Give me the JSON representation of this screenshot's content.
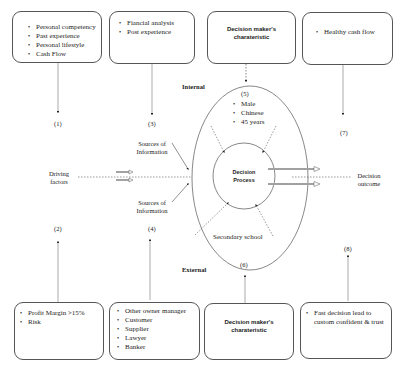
{
  "diagram": {
    "sections": {
      "internal": "Internal",
      "external": "External"
    },
    "top_boxes": [
      {
        "id": "1",
        "items": [
          "Personal competency",
          "Past experience",
          "Personal lifestyle",
          "Cash Flow"
        ]
      },
      {
        "id": "3",
        "items": [
          "Fiancial analysis",
          "Post experience"
        ]
      },
      {
        "id": "5",
        "title": "Decision maker's charateristic"
      },
      {
        "id": "7",
        "items": [
          "Healthy cash flow"
        ]
      }
    ],
    "bottom_boxes": [
      {
        "id": "2",
        "items": [
          "Profit Margin >15%",
          "Risk"
        ]
      },
      {
        "id": "4",
        "items": [
          "Other owner manager",
          "Customer",
          "Supplier",
          "Lawyer",
          "Banker"
        ]
      },
      {
        "id": "6",
        "title": "Decision maker's charateristic"
      },
      {
        "id": "8",
        "items": [
          "Fast decision lead to custom confident & trust"
        ]
      }
    ],
    "numbers": [
      "(1)",
      "(2)",
      "(3)",
      "(4)",
      "(5)",
      "(6)",
      "(7)",
      "(8)"
    ],
    "driving_factors": "Driving factors",
    "sources_top": "Sources of Information",
    "sources_bottom": "Sources of Information",
    "decision_process": "Decision Process",
    "decision_outcome": "Decision outcome",
    "outer_ellipse_top": [
      "Male",
      "Chinese",
      "45 years"
    ],
    "outer_ellipse_bottom": "Secondary school"
  }
}
